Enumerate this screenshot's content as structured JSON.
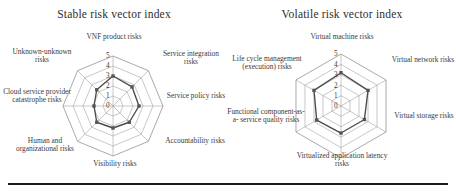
{
  "figure": {
    "background": "#ffffff",
    "grid_color": "#9a9a9a",
    "series_color": "#4a4a4a",
    "marker_color": "#555555",
    "baseline_color": "#1b1b1b"
  },
  "chart_data": [
    {
      "type": "radar",
      "title": "Stable risk vector index",
      "xlabel": "",
      "ylabel": "",
      "ylim": [
        0,
        5
      ],
      "tick_labels": [
        "0",
        "1",
        "2",
        "3",
        "4",
        "5"
      ],
      "grid": true,
      "legend": "none",
      "categories": [
        "VNF product risks",
        "Service integration risks",
        "Service policy risks",
        "Accountability risks",
        "Visibility risks",
        "Human and organizational risks",
        "Cloud service provider catastrophe risks",
        "Unknown-unknown risks"
      ],
      "series": [
        {
          "name": "Stable risk vector index",
          "values": [
            3.0,
            2.7,
            2.6,
            2.3,
            2.2,
            2.3,
            1.9,
            2.3
          ]
        }
      ]
    },
    {
      "type": "radar",
      "title": "Volatile risk vector index",
      "xlabel": "",
      "ylabel": "",
      "ylim": [
        0,
        5
      ],
      "tick_labels": [
        "0",
        "1",
        "2",
        "3",
        "4",
        "5"
      ],
      "grid": true,
      "legend": "none",
      "categories": [
        "Virtual machine risks",
        "Virtual network risks",
        "Virtual storage risks",
        "Virtualized application latency risks",
        "Functional component-as-a-service quality risks",
        "Life cycle management (execution) risks"
      ],
      "series": [
        {
          "name": "Volatile risk vector index",
          "values": [
            3.2,
            3.0,
            2.6,
            2.6,
            2.7,
            3.0
          ]
        }
      ]
    }
  ],
  "left_panel": {
    "title": "Stable risk vector index",
    "ticks": [
      "5",
      "4",
      "3",
      "2",
      "1",
      "0"
    ],
    "labels": [
      "VNF product risks",
      "Service integration risks",
      "Service policy risks",
      "Accountability risks",
      "Visibility risks",
      "Human and organizational risks",
      "Cloud service provider catastrophe risks",
      "Unknown-unknown risks"
    ]
  },
  "right_panel": {
    "title": "Volatile risk vector index",
    "ticks": [
      "5",
      "4",
      "3",
      "2",
      "1",
      "0"
    ],
    "labels": [
      "Virtual machine risks",
      "Virtual network risks",
      "Virtual storage risks",
      "Virtualized application latency risks",
      "Functional component-as-a- service quality risks",
      "Life cycle management (execution) risks"
    ]
  }
}
